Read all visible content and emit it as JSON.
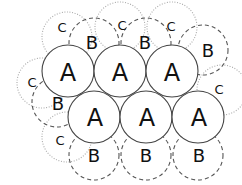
{
  "diagram": {
    "colors": {
      "a_stroke": "#444444",
      "b_stroke": "#555555",
      "c_stroke": "#aaaaaa",
      "text": "#111111"
    },
    "layers": {
      "A": {
        "label": "A",
        "style": "solid",
        "radius": 26,
        "circles": [
          {
            "label": "A",
            "cx": 68,
            "cy": 71
          },
          {
            "label": "A",
            "cx": 120,
            "cy": 71
          },
          {
            "label": "A",
            "cx": 172,
            "cy": 71
          },
          {
            "label": "A",
            "cx": 94,
            "cy": 117
          },
          {
            "label": "A",
            "cx": 146,
            "cy": 117
          },
          {
            "label": "A",
            "cx": 198,
            "cy": 117
          }
        ]
      },
      "B": {
        "label": "B",
        "style": "dashed",
        "radius": 25,
        "circles": [
          {
            "label": "B",
            "cx": 94,
            "cy": 43
          },
          {
            "label": "B",
            "cx": 146,
            "cy": 43
          },
          {
            "label": "B",
            "cx": 203,
            "cy": 50
          },
          {
            "label": "B",
            "cx": 57,
            "cy": 102
          },
          {
            "label": "B",
            "cx": 94,
            "cy": 155
          },
          {
            "label": "B",
            "cx": 146,
            "cy": 155
          },
          {
            "label": "B",
            "cx": 198,
            "cy": 155
          }
        ]
      },
      "C": {
        "label": "C",
        "style": "dotted",
        "radius": 25,
        "circles": [
          {
            "label": "C",
            "cx": 67,
            "cy": 37
          },
          {
            "label": "C",
            "cx": 120,
            "cy": 27
          },
          {
            "label": "C",
            "cx": 172,
            "cy": 27
          },
          {
            "label": "C",
            "cx": 42,
            "cy": 83
          },
          {
            "label": "C",
            "cx": 67,
            "cy": 137
          },
          {
            "label": "C",
            "cx": 222,
            "cy": 90
          }
        ]
      }
    },
    "label_positions": {
      "C": [
        [
          62,
          27
        ],
        [
          122,
          25
        ],
        [
          171,
          26
        ],
        [
          32,
          82
        ],
        [
          60,
          140
        ],
        [
          219,
          89
        ]
      ],
      "B": [
        [
          92,
          42
        ],
        [
          145,
          42
        ],
        [
          208,
          50
        ],
        [
          58,
          103
        ],
        [
          94,
          155
        ],
        [
          146,
          155
        ],
        [
          199,
          155
        ]
      ],
      "A": [
        [
          68,
          73
        ],
        [
          120,
          73
        ],
        [
          172,
          73
        ],
        [
          95,
          118
        ],
        [
          147,
          118
        ],
        [
          199,
          118
        ]
      ]
    }
  }
}
